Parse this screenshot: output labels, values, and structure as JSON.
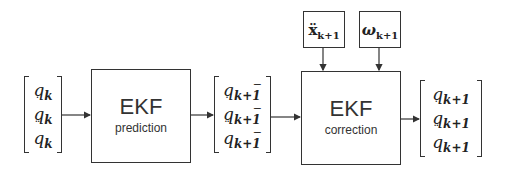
{
  "diagram": {
    "type": "block-diagram",
    "blocks": [
      {
        "id": "prediction",
        "title": "EKF",
        "subtitle": "prediction"
      },
      {
        "id": "correction",
        "title": "EKF",
        "subtitle": "correction"
      }
    ],
    "inputs": [
      {
        "id": "accel",
        "symbol": "ẍ",
        "subscript": "k+1"
      },
      {
        "id": "omega",
        "symbol": "ω",
        "subscript": "k+1"
      }
    ],
    "state_in": {
      "entries": [
        {
          "sym": "q",
          "dots": "",
          "sub": "k"
        },
        {
          "sym": "q",
          "dots": "˙",
          "sub": "k"
        },
        {
          "sym": "q",
          "dots": "¨",
          "sub": "k"
        }
      ]
    },
    "state_prior": {
      "superscript": "−",
      "entries": [
        {
          "sym": "q",
          "dots": "",
          "sub": "k+1"
        },
        {
          "sym": "q",
          "dots": "˙",
          "sub": "k+1"
        },
        {
          "sym": "q",
          "dots": "¨",
          "sub": "k+1"
        }
      ]
    },
    "state_out": {
      "entries": [
        {
          "sym": "q",
          "dots": "",
          "sub": "k+1"
        },
        {
          "sym": "q",
          "dots": "˙",
          "sub": "k+1"
        },
        {
          "sym": "q",
          "dots": "¨",
          "sub": "k+1"
        }
      ]
    },
    "edges": [
      {
        "from": "state_in",
        "to": "prediction"
      },
      {
        "from": "prediction",
        "to": "state_prior"
      },
      {
        "from": "state_prior",
        "to": "correction"
      },
      {
        "from": "accel",
        "to": "correction"
      },
      {
        "from": "omega",
        "to": "correction"
      },
      {
        "from": "correction",
        "to": "state_out"
      }
    ],
    "colors": {
      "stroke": "#333333",
      "background": "#ffffff"
    }
  }
}
